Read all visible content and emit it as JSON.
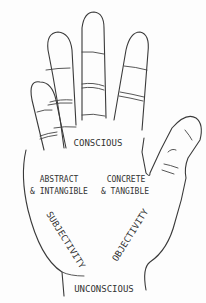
{
  "diagram": {
    "labels": {
      "top": "CONSCIOUS",
      "left_upper_line1": "ABSTRACT",
      "left_upper_line2": "& INTANGIBLE",
      "right_upper_line1": "CONCRETE",
      "right_upper_line2": "& TANGIBLE",
      "left_diagonal": "SUBJECTIVITY",
      "right_diagonal": "OBJECTIVITY",
      "bottom": "UNCONSCIOUS"
    },
    "colors": {
      "line": "#3a3a3a",
      "text": "#333333",
      "background": "#fdfdfd"
    }
  }
}
